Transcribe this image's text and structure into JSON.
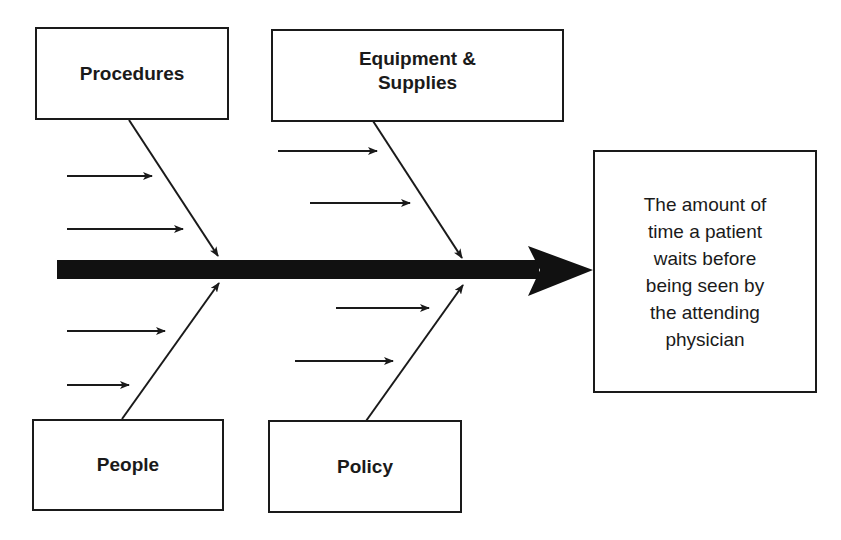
{
  "diagram": {
    "type": "fishbone (cause-and-effect / Ishikawa)",
    "effect": {
      "label": "The amount of\ntime a patient\nwaits before\nbeing seen by\nthe attending\nphysician"
    },
    "causes": [
      {
        "id": "procedures",
        "label": "Procedures",
        "position": "top-left",
        "sub_cause_arrows": 2
      },
      {
        "id": "equipment",
        "label": "Equipment &\nSupplies",
        "position": "top-right",
        "sub_cause_arrows": 2
      },
      {
        "id": "people",
        "label": "People",
        "position": "bottom-left",
        "sub_cause_arrows": 2
      },
      {
        "id": "policy",
        "label": "Policy",
        "position": "bottom-right",
        "sub_cause_arrows": 2
      }
    ],
    "colors": {
      "line": "#1a1a1a",
      "background": "#ffffff"
    }
  }
}
